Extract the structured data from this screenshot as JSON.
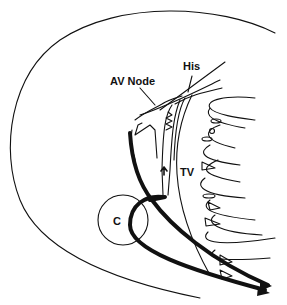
{
  "diagram": {
    "labels": {
      "av_node": "AV Node",
      "his": "His",
      "tv": "TV",
      "cs": "C"
    }
  }
}
